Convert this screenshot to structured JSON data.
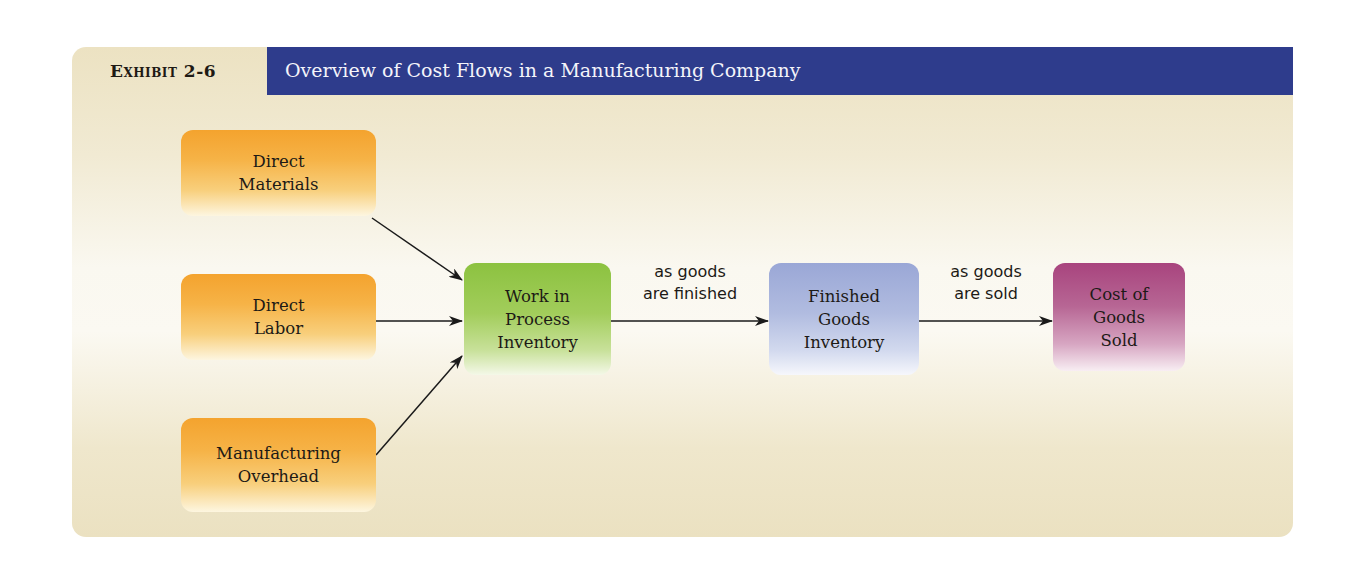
{
  "header": {
    "exhibit_label": "Exhibit 2-6",
    "title": "Overview of Cost Flows in a Manufacturing Company"
  },
  "inputs": [
    {
      "label": "Direct\nMaterials"
    },
    {
      "label": "Direct\nLabor"
    },
    {
      "label": "Manufacturing\nOverhead"
    }
  ],
  "stages": {
    "wip": {
      "label": "Work in\nProcess\nInventory"
    },
    "finished_goods": {
      "label": "Finished\nGoods\nInventory"
    },
    "cogs": {
      "label": "Cost of\nGoods\nSold"
    }
  },
  "flows": {
    "wip_to_fg": "as goods\nare finished",
    "fg_to_cogs": "as goods\nare sold"
  },
  "colors": {
    "banner": "#2e3c8c",
    "inputs": "#f4a32e",
    "wip": "#8cc240",
    "finished_goods": "#9aa7d6",
    "cogs": "#a8447e",
    "panel": "#ece2c2"
  }
}
